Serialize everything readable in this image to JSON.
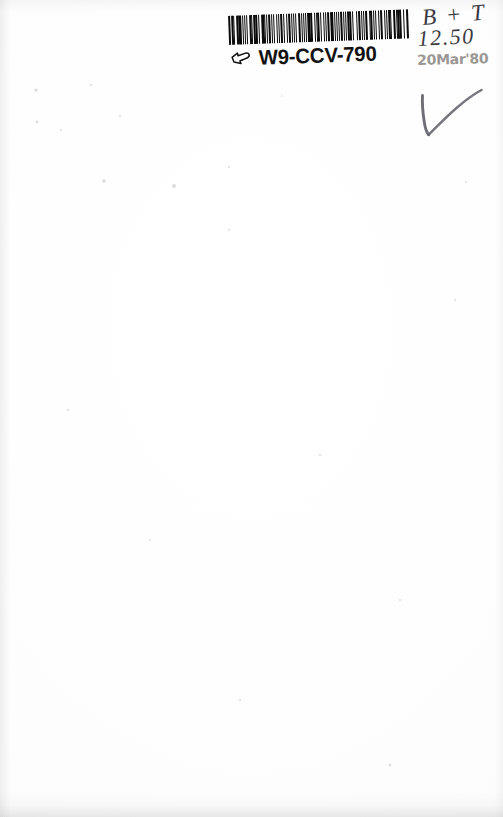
{
  "document": {
    "type": "scanned-book-cover",
    "background_color": "#fefefe"
  },
  "barcode_label": {
    "code_text": "W9-CCV-790",
    "hand_icon_name": "pointing-hand-icon",
    "bar_color": "#0b0b0b",
    "bar_widths": [
      3,
      2,
      1,
      2,
      4,
      1,
      2,
      1,
      3,
      1,
      2,
      2,
      1,
      4,
      1,
      1,
      3,
      2,
      1,
      2,
      1,
      3,
      1,
      2,
      4,
      1,
      1,
      2,
      3,
      1,
      2,
      1,
      4,
      2,
      1,
      1,
      3,
      2,
      2,
      1,
      2,
      4,
      1,
      2,
      1,
      3,
      1,
      1,
      2,
      3,
      2,
      1,
      4,
      1,
      2,
      2,
      1,
      3,
      1,
      2,
      1,
      4,
      2,
      1,
      3,
      1,
      2,
      1,
      2,
      3,
      1,
      4
    ],
    "space_widths": [
      2,
      1,
      3,
      1,
      1,
      2,
      1,
      3,
      1,
      2,
      1,
      2,
      3,
      1,
      2,
      1,
      1,
      2,
      3,
      1,
      2,
      1,
      3,
      1,
      1,
      2,
      1,
      3,
      1,
      2,
      2,
      1,
      1,
      3,
      2,
      1,
      1,
      2,
      1,
      3,
      2,
      1,
      2,
      1,
      3,
      1,
      2,
      2,
      1,
      1,
      3,
      2,
      1,
      2,
      1,
      3,
      1,
      1,
      2,
      3,
      1,
      2,
      1,
      2,
      1,
      3,
      2,
      1,
      1,
      2,
      3
    ]
  },
  "annotations": {
    "initials": "B + T",
    "price": "12.50",
    "date_stamp": "20Mar'80",
    "checkmark_name": "pencil-checkmark"
  }
}
